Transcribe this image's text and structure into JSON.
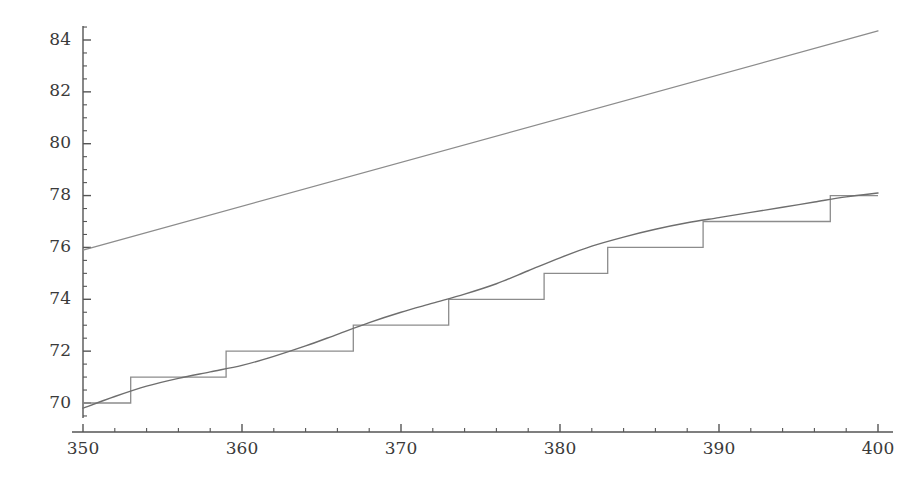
{
  "chart_data": {
    "type": "line",
    "title": "",
    "subtitle": "",
    "xlabel": "",
    "ylabel": "",
    "xlim": [
      350,
      400
    ],
    "ylim": [
      69.2,
      84.8
    ],
    "grid": false,
    "legend": null,
    "x_major_ticks": [
      350,
      360,
      370,
      380,
      390,
      400
    ],
    "x_tick_labels": [
      "350",
      "360",
      "370",
      "380",
      "390",
      "400"
    ],
    "x_minor_step": 2,
    "y_major_ticks": [
      70,
      72,
      74,
      76,
      78,
      80,
      82,
      84
    ],
    "y_tick_labels": [
      "70",
      "72",
      "74",
      "76",
      "78",
      "80",
      "82",
      "84"
    ],
    "y_minor_step": 0.5,
    "colors": {
      "upper_line": "#8c8c8c",
      "curve": "#6e6e6e",
      "step": "#8c8c8c",
      "axis": "#555555",
      "text": "#3a3a3a",
      "background": "#ffffff"
    },
    "series": [
      {
        "name": "upper-straight-line",
        "type": "line",
        "x": [
          350,
          400
        ],
        "values": [
          75.9,
          84.35
        ]
      },
      {
        "name": "smooth-curve",
        "type": "line",
        "x": [
          350,
          352,
          354,
          356,
          358,
          360,
          362,
          364,
          366,
          368,
          370,
          372,
          374,
          376,
          378,
          380,
          382,
          384,
          386,
          388,
          390,
          392,
          394,
          396,
          398,
          400
        ],
        "values": [
          69.8,
          70.25,
          70.65,
          70.95,
          71.2,
          71.45,
          71.8,
          72.2,
          72.65,
          73.1,
          73.5,
          73.85,
          74.2,
          74.6,
          75.1,
          75.6,
          76.05,
          76.4,
          76.7,
          76.95,
          77.15,
          77.35,
          77.55,
          77.75,
          77.95,
          78.1
        ]
      },
      {
        "name": "step-function",
        "type": "step",
        "step_edges": [
          350,
          353,
          359,
          367,
          373,
          379,
          383,
          389,
          397,
          400
        ],
        "values": [
          70,
          71,
          72,
          73,
          74,
          75,
          76,
          77,
          78
        ]
      }
    ]
  }
}
